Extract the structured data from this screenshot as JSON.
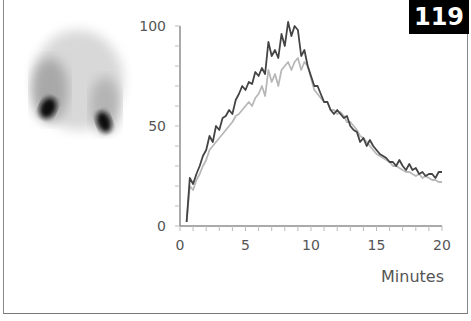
{
  "badge": {
    "number": "119"
  },
  "chart_data": {
    "type": "line",
    "title": "",
    "xlabel": "Minutes",
    "ylabel": "",
    "xlim": [
      0,
      20
    ],
    "ylim": [
      0,
      100
    ],
    "x_ticks": [
      "0",
      "5",
      "10",
      "15",
      "20"
    ],
    "y_ticks": [
      "0",
      "50",
      "100"
    ],
    "grid": false,
    "legend": null,
    "x": [
      0.5,
      0.75,
      1,
      1.25,
      1.5,
      1.75,
      2,
      2.25,
      2.5,
      2.75,
      3,
      3.25,
      3.5,
      3.75,
      4,
      4.25,
      4.5,
      4.75,
      5,
      5.25,
      5.5,
      5.75,
      6,
      6.25,
      6.5,
      6.75,
      7,
      7.25,
      7.5,
      7.75,
      8,
      8.25,
      8.5,
      8.75,
      9,
      9.25,
      9.5,
      9.75,
      10,
      10.25,
      10.5,
      10.75,
      11,
      11.25,
      11.5,
      11.75,
      12,
      12.25,
      12.5,
      12.75,
      13,
      13.25,
      13.5,
      13.75,
      14,
      14.25,
      14.5,
      14.75,
      15,
      15.25,
      15.5,
      15.75,
      16,
      16.25,
      16.5,
      16.75,
      17,
      17.25,
      17.5,
      17.75,
      18,
      18.25,
      18.5,
      18.75,
      19,
      19.25,
      19.5,
      19.75,
      20
    ],
    "series": [
      {
        "name": "dark (left kidney)",
        "color": "#444444",
        "values": [
          2,
          24,
          21,
          26,
          30,
          35,
          38,
          45,
          42,
          50,
          48,
          54,
          55,
          58,
          56,
          63,
          66,
          70,
          68,
          72,
          71,
          77,
          75,
          79,
          76,
          92,
          85,
          88,
          84,
          96,
          90,
          102,
          95,
          100,
          98,
          85,
          88,
          80,
          75,
          70,
          70,
          66,
          62,
          62,
          58,
          56,
          58,
          56,
          54,
          55,
          50,
          48,
          47,
          42,
          44,
          40,
          43,
          40,
          38,
          36,
          35,
          34,
          32,
          32,
          30,
          33,
          30,
          28,
          31,
          28,
          29,
          26,
          27,
          25,
          26,
          26,
          24,
          27,
          27
        ]
      },
      {
        "name": "light (right kidney)",
        "color": "#b8b8b8",
        "values": [
          2,
          20,
          18,
          23,
          26,
          30,
          33,
          38,
          40,
          42,
          44,
          46,
          48,
          50,
          52,
          55,
          56,
          58,
          60,
          62,
          60,
          64,
          66,
          70,
          65,
          78,
          72,
          76,
          70,
          78,
          80,
          82,
          78,
          82,
          84,
          78,
          82,
          80,
          74,
          68,
          66,
          64,
          62,
          62,
          58,
          58,
          56,
          57,
          55,
          52,
          52,
          50,
          48,
          45,
          44,
          42,
          40,
          38,
          36,
          35,
          34,
          33,
          32,
          30,
          30,
          29,
          28,
          27,
          27,
          26,
          25,
          26,
          24,
          25,
          24,
          23,
          23,
          22,
          22
        ]
      }
    ]
  },
  "image": {
    "label": "renal-scintigraphy-scan"
  }
}
